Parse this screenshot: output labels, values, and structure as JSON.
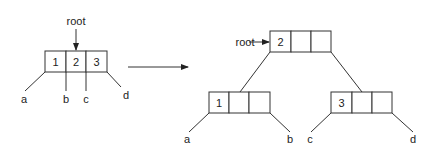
{
  "diagram": {
    "type": "b-tree-root-split",
    "before": {
      "root_label": "root",
      "node": {
        "keys": [
          "1",
          "2",
          "3"
        ]
      },
      "children": [
        "a",
        "b",
        "c",
        "d"
      ]
    },
    "transition_arrow": "right-arrow",
    "after": {
      "root_label": "root",
      "root_node": {
        "keys": [
          "2",
          "",
          ""
        ]
      },
      "left_node": {
        "keys": [
          "1",
          "",
          ""
        ],
        "children": [
          "a",
          "b"
        ]
      },
      "right_node": {
        "keys": [
          "3",
          "",
          ""
        ],
        "children": [
          "c",
          "d"
        ]
      }
    }
  }
}
